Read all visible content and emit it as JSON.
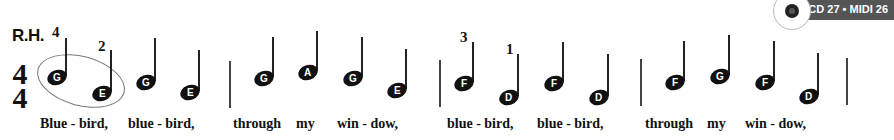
{
  "header": {
    "hand_label": "R.H.",
    "badge_text": "CD 27 • MIDI 26"
  },
  "time_signature": {
    "top": "4",
    "bottom": "4"
  },
  "fingerings": [
    {
      "value": "4",
      "x": 52,
      "y": 24
    },
    {
      "value": "2",
      "x": 98,
      "y": 38
    },
    {
      "value": "3",
      "x": 460,
      "y": 29
    },
    {
      "value": "1",
      "x": 506,
      "y": 41
    }
  ],
  "notes": [
    {
      "name": "G",
      "x": 47,
      "y": 70,
      "stem_top": 38,
      "stem_x": 65
    },
    {
      "name": "E",
      "x": 92,
      "y": 86,
      "stem_top": 50,
      "stem_x": 110
    },
    {
      "name": "G",
      "x": 136,
      "y": 75,
      "stem_top": 38,
      "stem_x": 154
    },
    {
      "name": "E",
      "x": 180,
      "y": 85,
      "stem_top": 50,
      "stem_x": 198
    },
    {
      "name": "G",
      "x": 254,
      "y": 71,
      "stem_top": 37,
      "stem_x": 272
    },
    {
      "name": "A",
      "x": 298,
      "y": 65,
      "stem_top": 31,
      "stem_x": 316
    },
    {
      "name": "G",
      "x": 343,
      "y": 71,
      "stem_top": 37,
      "stem_x": 361
    },
    {
      "name": "E",
      "x": 387,
      "y": 83,
      "stem_top": 49,
      "stem_x": 405
    },
    {
      "name": "F",
      "x": 454,
      "y": 76,
      "stem_top": 42,
      "stem_x": 472
    },
    {
      "name": "D",
      "x": 499,
      "y": 90,
      "stem_top": 54,
      "stem_x": 517
    },
    {
      "name": "F",
      "x": 544,
      "y": 76,
      "stem_top": 42,
      "stem_x": 562
    },
    {
      "name": "D",
      "x": 589,
      "y": 90,
      "stem_top": 54,
      "stem_x": 607
    },
    {
      "name": "F",
      "x": 665,
      "y": 75,
      "stem_top": 41,
      "stem_x": 683
    },
    {
      "name": "G",
      "x": 710,
      "y": 69,
      "stem_top": 35,
      "stem_x": 728
    },
    {
      "name": "F",
      "x": 755,
      "y": 75,
      "stem_top": 41,
      "stem_x": 773
    },
    {
      "name": "D",
      "x": 799,
      "y": 89,
      "stem_top": 53,
      "stem_x": 817
    }
  ],
  "barlines": [
    {
      "x": 229,
      "top": 61,
      "bottom": 108
    },
    {
      "x": 439,
      "top": 60,
      "bottom": 107
    },
    {
      "x": 640,
      "top": 59,
      "bottom": 106
    },
    {
      "x": 846,
      "top": 58,
      "bottom": 105
    }
  ],
  "lyrics": [
    {
      "text": "Blue - bird,",
      "x": 40
    },
    {
      "text": "blue - bird,",
      "x": 128
    },
    {
      "text": "through",
      "x": 233
    },
    {
      "text": "my",
      "x": 296
    },
    {
      "text": "win - dow,",
      "x": 337
    },
    {
      "text": "blue - bird,",
      "x": 447
    },
    {
      "text": "blue - bird,",
      "x": 537
    },
    {
      "text": "through",
      "x": 645
    },
    {
      "text": "my",
      "x": 707
    },
    {
      "text": "win - dow,",
      "x": 745
    }
  ]
}
